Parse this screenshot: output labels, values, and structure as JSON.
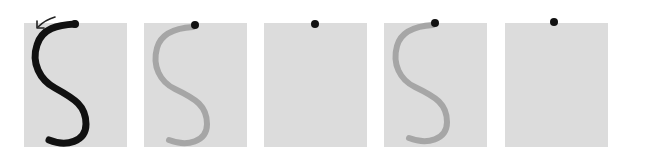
{
  "figure": {
    "background_color": "#ffffff",
    "panel_color": "#dcdcdc",
    "panels": [
      {
        "index": 1,
        "stroke": "solid",
        "stroke_color": "#111111",
        "dot": true,
        "arrow": true
      },
      {
        "index": 2,
        "stroke": "faded",
        "stroke_color": "#a6a6a6",
        "dot": true,
        "arrow": false
      },
      {
        "index": 3,
        "stroke": "none",
        "stroke_color": "",
        "dot": true,
        "arrow": false
      },
      {
        "index": 4,
        "stroke": "faded",
        "stroke_color": "#a6a6a6",
        "dot": true,
        "arrow": false
      },
      {
        "index": 5,
        "stroke": "none",
        "stroke_color": "",
        "dot": true,
        "arrow": false
      }
    ],
    "dot_color": "#111111"
  }
}
